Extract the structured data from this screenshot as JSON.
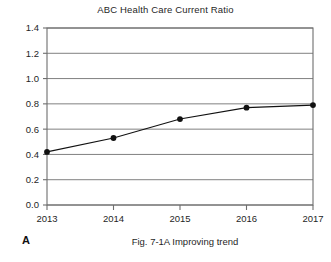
{
  "figure": {
    "panel_label": "A",
    "caption": "Fig. 7-1A Improving trend"
  },
  "chart_data": {
    "type": "line",
    "title": "ABC Health Care Current Ratio",
    "xlabel": "",
    "ylabel": "",
    "categories": [
      "2013",
      "2014",
      "2015",
      "2016",
      "2017"
    ],
    "values": [
      0.42,
      0.53,
      0.68,
      0.77,
      0.79
    ],
    "series": [
      {
        "name": "Current Ratio",
        "values": [
          0.42,
          0.53,
          0.68,
          0.77,
          0.79
        ]
      }
    ],
    "ylim": [
      0.0,
      1.4
    ],
    "ytick_step": 0.2,
    "ytick_labels": [
      "0.0",
      "0.2",
      "0.4",
      "0.6",
      "0.8",
      "1.0",
      "1.2",
      "1.4"
    ],
    "ytick_values": [
      0.0,
      0.2,
      0.4,
      0.6,
      0.8,
      1.0,
      1.2,
      1.4
    ],
    "xtick_labels": [
      "2013",
      "2014",
      "2015",
      "2016",
      "2017"
    ],
    "grid": "horizontal",
    "legend": "none",
    "marker": "filled-circle",
    "line_color": "#111111",
    "marker_color": "#111111",
    "grid_color": "#808080",
    "axis_color": "#6e6e6e",
    "plot_background": "#ffffff"
  }
}
